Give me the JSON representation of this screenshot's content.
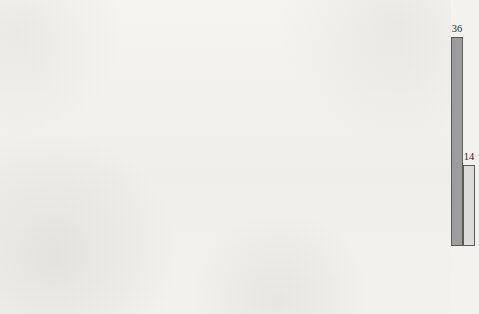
{
  "chart_data": {
    "type": "bar",
    "title": "",
    "subtitle": "",
    "xlabel": "",
    "ylabel": "Percent",
    "ylim": [
      0,
      38.5
    ],
    "yticks": [
      5,
      10,
      15,
      20,
      25,
      30,
      35
    ],
    "grid": false,
    "legend_position": "top-left",
    "grouping": "grouped",
    "categories": [
      "Ethnic groups",
      "News-papers",
      "Religious groups",
      "Party or ideo-logical groups",
      "Other unions",
      "Prom-inent indi-viduals",
      "Business groups",
      "Com-munity groups",
      "Parents",
      "No groups"
    ],
    "category_label_lines": [
      [
        "Ethnic",
        "groups"
      ],
      [
        "News-",
        "papers"
      ],
      [
        "Religious",
        "groups"
      ],
      [
        "Party",
        "or ideo-",
        "logical",
        "groups"
      ],
      [
        "Other",
        "unions"
      ],
      [
        "Prom-",
        "inent",
        "indi-",
        "viduals"
      ],
      [
        "Business",
        "groups"
      ],
      [
        "Com-",
        "munity",
        "groups"
      ],
      [
        "Parents"
      ],
      [
        "No",
        "groups"
      ]
    ],
    "series": [
      {
        "name": "Less than 10,000",
        "color": "#9d9d9d",
        "values": [
          1,
          2,
          4,
          6,
          7,
          8,
          11,
          15,
          34,
          36
        ]
      },
      {
        "name": "More than 10,000",
        "color": "#dcdcda",
        "values": [
          4,
          17,
          6,
          11,
          26,
          12,
          22,
          13,
          13,
          14
        ]
      }
    ]
  },
  "legend": {
    "items": [
      {
        "label": "Less than 10,000",
        "swatch": "series-0"
      },
      {
        "label": "More than 10,000",
        "swatch": "series-1"
      }
    ]
  },
  "colors": {
    "series_less": "#9d9d9d",
    "series_more": "#dcdcda",
    "axis": "#585858",
    "text": "#2b2b2b",
    "page_background": "#f2f1ed"
  }
}
